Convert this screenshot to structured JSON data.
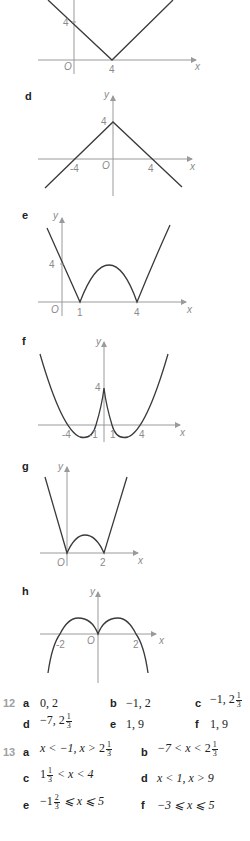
{
  "graphs": {
    "c": {
      "letter": "",
      "y_tick": "4",
      "origin": "O",
      "x_ticks": [
        "4"
      ],
      "x_name": "x"
    },
    "d": {
      "letter": "d",
      "y_name": "y",
      "y_tick": "4",
      "origin": "O",
      "x_ticks": [
        "-4",
        "4"
      ],
      "x_name": "x"
    },
    "e": {
      "letter": "e",
      "y_name": "y",
      "y_tick": "4",
      "origin": "O",
      "x_ticks": [
        "1",
        "4"
      ],
      "x_name": "x"
    },
    "f": {
      "letter": "f",
      "y_name": "y",
      "y_tick": "4",
      "x_ticks": [
        "-4",
        "-1",
        "1",
        "4"
      ],
      "x_name": "x"
    },
    "g": {
      "letter": "g",
      "y_name": "y",
      "origin": "O",
      "x_ticks": [
        "2"
      ],
      "x_name": "x"
    },
    "h": {
      "letter": "h",
      "y_name": "y",
      "origin": "O",
      "x_ticks": [
        "-2",
        "2"
      ],
      "x_name": "x"
    }
  },
  "q12": {
    "number": "12",
    "items": [
      {
        "letter": "a",
        "pre": "0, 2",
        "frac_whole": "",
        "num": "",
        "den": "",
        "post": ""
      },
      {
        "letter": "b",
        "pre": "−1, 2",
        "frac_whole": "",
        "num": "",
        "den": "",
        "post": ""
      },
      {
        "letter": "c",
        "pre": "−1, ",
        "frac_whole": "2",
        "num": "1",
        "den": "3",
        "post": ""
      },
      {
        "letter": "d",
        "pre": "−7, ",
        "frac_whole": "2",
        "num": "1",
        "den": "3",
        "post": ""
      },
      {
        "letter": "e",
        "pre": "1, 9",
        "frac_whole": "",
        "num": "",
        "den": "",
        "post": ""
      },
      {
        "letter": "f",
        "pre": "1, 9",
        "frac_whole": "",
        "num": "",
        "den": "",
        "post": ""
      }
    ]
  },
  "q13": {
    "number": "13",
    "items": [
      {
        "letter": "a",
        "pre": "x < −1, x > ",
        "frac_whole": "2",
        "num": "1",
        "den": "3",
        "post": ""
      },
      {
        "letter": "b",
        "pre": "−7 < x < ",
        "frac_whole": "2",
        "num": "1",
        "den": "3",
        "post": ""
      },
      {
        "letter": "c",
        "pre": "",
        "frac_whole": "1",
        "num": "1",
        "den": "3",
        "post": " < x < 4"
      },
      {
        "letter": "d",
        "pre": "x < 1, x > 9",
        "frac_whole": "",
        "num": "",
        "den": "",
        "post": ""
      },
      {
        "letter": "e",
        "pre": "−",
        "frac_whole": "1",
        "num": "2",
        "den": "3",
        "post": " ⩽ x ⩽ 5"
      },
      {
        "letter": "f",
        "pre": "−3 ⩽ x ⩽ 5",
        "frac_whole": "",
        "num": "",
        "den": "",
        "post": ""
      }
    ]
  }
}
